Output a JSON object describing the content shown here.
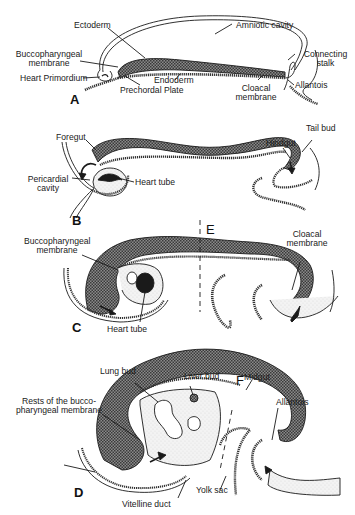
{
  "figure": {
    "colors": {
      "ink": "#1a1a1a",
      "hatch_fill": "#6a6a6a",
      "stipple_fill": "#e9e9e9",
      "background": "#ffffff"
    },
    "panels": [
      {
        "id": "A",
        "letter": "A",
        "labels": {
          "ectoderm": "Ectoderm",
          "amniotic_cavity": "Amniotic cavity",
          "buccopharyngeal_membrane": "Buccopharyngeal membrane",
          "heart_primordium": "Heart Primordium",
          "endoderm": "Endoderm",
          "prechordal_plate": "Prechordal Plate",
          "cloacal_membrane": "Cloacal membrane",
          "connecting_stalk": "Connecting stalk",
          "allantois": "Allantois"
        }
      },
      {
        "id": "B",
        "letter": "B",
        "labels": {
          "foregut": "Foregut",
          "pericardial_cavity": "Pericardial cavity",
          "heart_tube": "Heart tube",
          "hindgut": "Hindgut",
          "tail_bud": "Tail bud"
        }
      },
      {
        "id": "C",
        "letter": "C",
        "section_line": "E",
        "labels": {
          "buccopharyngeal_membrane": "Buccopharyngeal membrane",
          "heart_tube": "Heart tube",
          "cloacal_membrane": "Cloacal membrane"
        }
      },
      {
        "id": "D",
        "letter": "D",
        "section_line": "F",
        "labels": {
          "lung_bud": "Lung bud",
          "liver_bud": "Liver bud",
          "midgut": "Midgut",
          "rests_buccopharyngeal": "Rests of the bucco-pharyngeal membrane",
          "allantois": "Allantois",
          "vitelline_duct": "Vitelline duct",
          "yolk_sac": "Yolk sac"
        }
      }
    ]
  }
}
